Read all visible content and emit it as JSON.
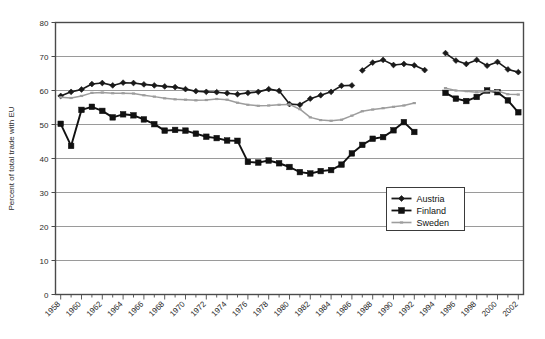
{
  "chart_data": {
    "type": "line",
    "title": "",
    "xlabel": "",
    "ylabel": "Percent of total trade with EU",
    "xlim": [
      1957.5,
      2002.5
    ],
    "ylim": [
      0,
      80
    ],
    "yticks": [
      0,
      10,
      20,
      30,
      40,
      50,
      60,
      70,
      80
    ],
    "xticks": [
      1958,
      1960,
      1962,
      1964,
      1966,
      1968,
      1970,
      1972,
      1974,
      1976,
      1978,
      1980,
      1982,
      1984,
      1986,
      1988,
      1990,
      1992,
      1994,
      1996,
      1998,
      2000,
      2002
    ],
    "xtick_labels": [
      "1958",
      "1960",
      "1962",
      "1964",
      "1966",
      "1968",
      "1970",
      "1972",
      "1974",
      "1976",
      "1978",
      "1980",
      "1982",
      "1984",
      "1986",
      "1988",
      "1990",
      "1992",
      "1994",
      "1996",
      "1998",
      "2000",
      "2002"
    ],
    "grid": "horizontal",
    "legend_position": "inside-right-middle",
    "x": [
      1958,
      1959,
      1960,
      1961,
      1962,
      1963,
      1964,
      1965,
      1966,
      1967,
      1968,
      1969,
      1970,
      1971,
      1972,
      1973,
      1974,
      1975,
      1976,
      1977,
      1978,
      1979,
      1980,
      1981,
      1982,
      1983,
      1984,
      1985,
      1986,
      1987,
      1988,
      1989,
      1990,
      1991,
      1992,
      1993,
      1994,
      1995,
      1996,
      1997,
      1998,
      1999,
      2000,
      2001,
      2002
    ],
    "series": [
      {
        "name": "Austria",
        "color": "#1a1a1a",
        "marker": "diamond",
        "values": [
          58.4,
          59.6,
          60.3,
          61.9,
          62.2,
          61.5,
          62.3,
          62.2,
          61.8,
          61.5,
          61.2,
          61.0,
          60.4,
          59.8,
          59.6,
          59.5,
          59.2,
          58.9,
          59.3,
          59.6,
          60.4,
          59.9,
          56.0,
          55.8,
          57.6,
          58.6,
          59.6,
          61.4,
          61.5,
          null,
          null,
          null,
          null,
          null,
          null,
          null,
          null,
          null,
          null,
          null,
          null,
          null,
          null,
          null,
          null
        ]
      },
      {
        "name": "Austria-b",
        "color": "#1a1a1a",
        "marker": "diamond",
        "values": [
          null,
          null,
          null,
          null,
          null,
          null,
          null,
          null,
          null,
          null,
          null,
          null,
          null,
          null,
          null,
          null,
          null,
          null,
          null,
          null,
          null,
          null,
          null,
          null,
          null,
          null,
          null,
          null,
          null,
          65.9,
          68.2,
          69.0,
          67.5,
          67.8,
          67.4,
          66.0,
          null,
          null,
          null,
          null,
          null,
          null,
          null,
          null,
          null
        ]
      },
      {
        "name": "Austria-c",
        "color": "#1a1a1a",
        "marker": "diamond",
        "values": [
          null,
          null,
          null,
          null,
          null,
          null,
          null,
          null,
          null,
          null,
          null,
          null,
          null,
          null,
          null,
          null,
          null,
          null,
          null,
          null,
          null,
          null,
          null,
          null,
          null,
          null,
          null,
          null,
          null,
          null,
          null,
          null,
          null,
          null,
          null,
          null,
          null,
          71.0,
          68.8,
          67.8,
          69.0,
          67.3,
          68.4,
          66.2,
          65.4
        ]
      },
      {
        "name": "Finland",
        "color": "#111111",
        "marker": "square",
        "values": [
          50.2,
          43.7,
          54.3,
          55.2,
          54.0,
          52.1,
          53.0,
          52.7,
          51.5,
          50.1,
          48.2,
          48.4,
          48.2,
          47.3,
          46.4,
          46.0,
          45.3,
          45.2,
          39.0,
          38.8,
          39.4,
          38.6,
          37.5,
          36.0,
          35.6,
          36.3,
          36.6,
          38.2,
          41.5,
          44.0,
          45.8,
          46.3,
          48.3,
          50.7,
          47.8,
          null,
          null,
          null,
          null,
          null,
          null,
          null,
          null,
          null,
          null
        ]
      },
      {
        "name": "Finland-b",
        "color": "#111111",
        "marker": "square",
        "values": [
          null,
          null,
          null,
          null,
          null,
          null,
          null,
          null,
          null,
          null,
          null,
          null,
          null,
          null,
          null,
          null,
          null,
          null,
          null,
          null,
          null,
          null,
          null,
          null,
          null,
          null,
          null,
          null,
          null,
          null,
          null,
          null,
          null,
          null,
          null,
          null,
          null,
          59.3,
          57.6,
          56.9,
          58.1,
          60.0,
          59.5,
          57.1,
          53.6
        ]
      },
      {
        "name": "Sweden",
        "color": "#9d9d9d",
        "marker": "dash",
        "values": [
          58.0,
          57.8,
          58.4,
          59.3,
          59.4,
          59.2,
          59.2,
          59.1,
          58.6,
          58.2,
          57.7,
          57.4,
          57.3,
          57.1,
          57.2,
          57.5,
          57.3,
          56.4,
          55.8,
          55.5,
          55.6,
          55.8,
          55.9,
          54.5,
          52.1,
          51.3,
          51.1,
          51.4,
          52.6,
          53.9,
          54.4,
          54.8,
          55.2,
          55.6,
          56.3,
          null,
          null,
          null,
          null,
          null,
          null,
          null,
          null,
          null,
          null
        ]
      },
      {
        "name": "Sweden-b",
        "color": "#9d9d9d",
        "marker": "dash",
        "values": [
          null,
          null,
          null,
          null,
          null,
          null,
          null,
          null,
          null,
          null,
          null,
          null,
          null,
          null,
          null,
          null,
          null,
          null,
          null,
          null,
          null,
          null,
          null,
          null,
          null,
          null,
          null,
          null,
          null,
          null,
          null,
          null,
          null,
          null,
          null,
          null,
          null,
          60.7,
          60.0,
          59.8,
          59.5,
          59.8,
          59.9,
          58.9,
          58.8
        ]
      }
    ],
    "legend": [
      {
        "label": "Austria",
        "color": "#1a1a1a",
        "marker": "diamond"
      },
      {
        "label": "Finland",
        "color": "#111111",
        "marker": "square"
      },
      {
        "label": "Sweden",
        "color": "#9d9d9d",
        "marker": "dash"
      }
    ]
  }
}
